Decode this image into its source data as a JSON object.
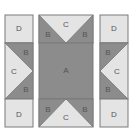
{
  "diagram": {
    "type": "quilt-block-assembly",
    "colors": {
      "light": "#e4e4e4",
      "dark": "#8c8c8c",
      "border": "#7a7a7a"
    },
    "left_column": {
      "top": "D",
      "middle": {
        "center": "C",
        "top_right": "B",
        "bottom_right": "B"
      },
      "bottom": "D"
    },
    "center_column": {
      "top": {
        "center": "C",
        "left": "B",
        "right": "B"
      },
      "middle": "A",
      "bottom": {
        "center": "C",
        "left": "B",
        "right": "B"
      }
    },
    "right_column": {
      "top": "D",
      "middle": {
        "center": "C",
        "top_left": "B",
        "bottom_left": "B"
      },
      "bottom": "D"
    }
  }
}
